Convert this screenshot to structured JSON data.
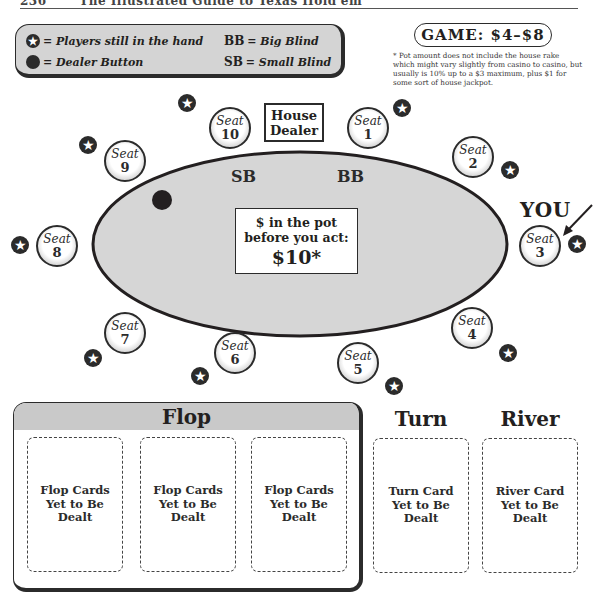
{
  "page_header": {
    "number": "236",
    "title": "The Illustrated Guide to Texas Hold'em"
  },
  "legend": {
    "players_in_hand": "= Players still in the hand",
    "dealer_button": "= Dealer Button",
    "bb_abbr": "BB",
    "bb_text": "= Big Blind",
    "sb_abbr": "SB",
    "sb_text": "= Small Blind",
    "star_glyph": "★"
  },
  "game": {
    "label": "GAME: $4–$8",
    "footnote": "* Pot amount does not include the house rake which might vary slightly from casino to casino, but usually is 10% up to a $3 maximum, plus $1 for some sort of house jackpot."
  },
  "table": {
    "house_dealer": "House Dealer",
    "small_blind": "SB",
    "big_blind": "BB",
    "pot_label": "$ in the pot before you act:",
    "pot_value": "$10*",
    "you_label": "YOU",
    "seat_word": "Seat",
    "seats": [
      {
        "number": "1",
        "in_hand": true
      },
      {
        "number": "2",
        "in_hand": true
      },
      {
        "number": "3",
        "in_hand": true,
        "is_you": true
      },
      {
        "number": "4",
        "in_hand": true
      },
      {
        "number": "5",
        "in_hand": true
      },
      {
        "number": "6",
        "in_hand": true
      },
      {
        "number": "7",
        "in_hand": true
      },
      {
        "number": "8",
        "in_hand": true
      },
      {
        "number": "9",
        "in_hand": true,
        "dealer_button": true
      },
      {
        "number": "10",
        "in_hand": true,
        "small_blind": true
      }
    ],
    "colors": {
      "felt": "#d6d6d6",
      "outline": "#231f20"
    }
  },
  "board": {
    "flop": {
      "title": "Flop",
      "cards": [
        "Flop Cards Yet to Be Dealt",
        "Flop Cards Yet to Be Dealt",
        "Flop Cards Yet to Be Dealt"
      ]
    },
    "turn": {
      "title": "Turn",
      "card": "Turn Card Yet to Be Dealt"
    },
    "river": {
      "title": "River",
      "card": "River Card Yet to Be Dealt"
    }
  }
}
